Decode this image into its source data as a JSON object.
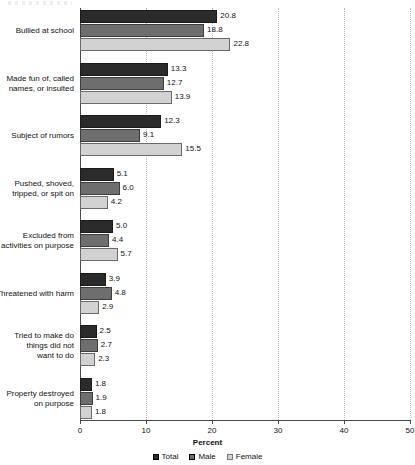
{
  "chart_data": {
    "type": "bar",
    "orientation": "horizontal",
    "title": "",
    "xlabel": "Percent",
    "ylabel": "",
    "xlim": [
      0,
      50
    ],
    "xticks": [
      "0",
      "10",
      "20",
      "30",
      "40",
      "50"
    ],
    "grid": "vertical-dotted",
    "legend_position": "bottom-center",
    "categories": [
      "Bullied at school",
      "Made fun of, called names, or insulted",
      "Subject of rumors",
      "Pushed, shoved, tripped, or spit on",
      "Excluded from activities on purpose",
      "Threatened with harm",
      "Tried to make do things did not want to do",
      "Property destroyed on purpose"
    ],
    "category_lines": [
      [
        "Bullied at school"
      ],
      [
        "Made fun of, called",
        "names, or insulted"
      ],
      [
        "Subject of rumors"
      ],
      [
        "Pushed, shoved,",
        "tripped, or spit on"
      ],
      [
        "Excluded from",
        "activities on purpose"
      ],
      [
        "Threatened with harm"
      ],
      [
        "Tried to make do",
        "things did not",
        "want to do"
      ],
      [
        "Property destroyed",
        "on purpose"
      ]
    ],
    "series": [
      {
        "name": "Total",
        "color": "#2b2b2b",
        "values": [
          20.8,
          13.3,
          12.3,
          5.1,
          5.0,
          3.9,
          2.5,
          1.8
        ],
        "labels": [
          "20.8",
          "13.3",
          "12.3",
          "5.1",
          "5.0",
          "3.9",
          "2.5",
          "1.8"
        ]
      },
      {
        "name": "Male",
        "color": "#6e6e6e",
        "values": [
          18.8,
          12.7,
          9.1,
          6.0,
          4.4,
          4.8,
          2.7,
          1.9
        ],
        "labels": [
          "18.8",
          "12.7",
          "9.1",
          "6.0",
          "4.4",
          "4.8",
          "2.7",
          "1.9"
        ]
      },
      {
        "name": "Female",
        "color": "#d2d2d2",
        "values": [
          22.8,
          13.9,
          15.5,
          4.2,
          5.7,
          2.9,
          2.3,
          1.8
        ],
        "labels": [
          "22.8",
          "13.9",
          "15.5",
          "4.2",
          "5.7",
          "2.9",
          "2.3",
          "1.8"
        ]
      }
    ]
  }
}
